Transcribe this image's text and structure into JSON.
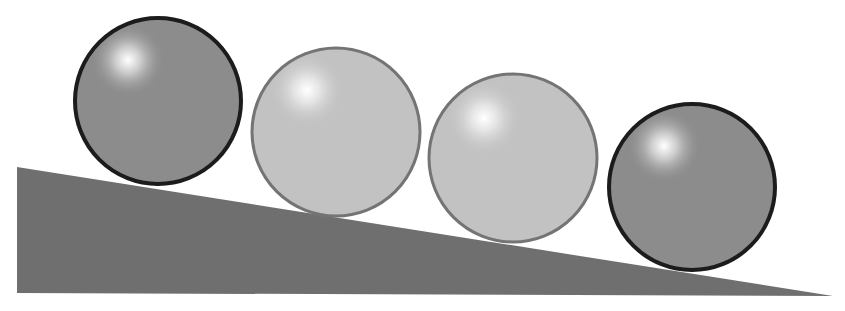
{
  "scene": {
    "description": "Four spheres resting on an inclined plane",
    "background_color": "#ffffff",
    "ramp": {
      "color": "#6f6f6f",
      "points": [
        [
          17,
          167
        ],
        [
          833,
          296
        ],
        [
          17,
          293
        ]
      ]
    },
    "spheres": [
      {
        "label": "sphere-1",
        "cx": 158,
        "cy": 101,
        "r": 83,
        "fill": "#8c8c8c",
        "stroke": "#1c1c1c",
        "stroke_width": 4,
        "highlight": [
          128,
          60
        ]
      },
      {
        "label": "sphere-2",
        "cx": 336,
        "cy": 132,
        "r": 84,
        "fill": "#c2c2c2",
        "stroke": "#747474",
        "stroke_width": 3,
        "highlight": [
          307,
          90
        ]
      },
      {
        "label": "sphere-3",
        "cx": 513,
        "cy": 158,
        "r": 84,
        "fill": "#c2c2c2",
        "stroke": "#747474",
        "stroke_width": 3,
        "highlight": [
          484,
          118
        ]
      },
      {
        "label": "sphere-4",
        "cx": 692,
        "cy": 187,
        "r": 83,
        "fill": "#8c8c8c",
        "stroke": "#1c1c1c",
        "stroke_width": 4,
        "highlight": [
          664,
          146
        ]
      }
    ]
  }
}
